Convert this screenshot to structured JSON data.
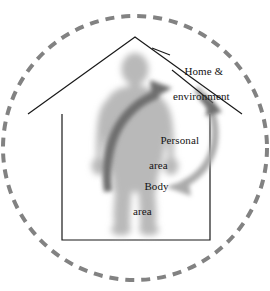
{
  "figure": {
    "width": 270,
    "height": 291,
    "background_color": "#ffffff"
  },
  "labels": {
    "home_environment": {
      "line1": "Home &",
      "line2": "environment",
      "icon": "leader-line-to-outer-arrow"
    },
    "personal_area": {
      "line1": "Personal",
      "line2": "area"
    },
    "body_area": {
      "line1": "Body",
      "line2": "area"
    }
  },
  "shapes": {
    "outer_boundary": {
      "name": "dashed-circle",
      "color": "#808080",
      "stroke_width": 4,
      "dash": "9 7",
      "center_x": 135,
      "center_y": 148,
      "radius": 133
    },
    "house": {
      "name": "house-outline",
      "color": "#1a1a1a",
      "stroke_width": 1.2,
      "apex_x": 135,
      "apex_y": 37,
      "eave_left_x": 28,
      "eave_right_x": 242,
      "eave_y": 114,
      "wall_left_x": 62,
      "wall_right_x": 210,
      "floor_y": 240
    },
    "body_silhouette": {
      "name": "human-figure",
      "color": "#b9b9b9",
      "blur": 4,
      "center_x": 135,
      "head_top_y": 55,
      "feet_y": 233
    },
    "body_area_arrow": {
      "name": "body-area-curved-arrow",
      "color": "#6e6e6e"
    },
    "personal_area_arrow": {
      "name": "personal-area-curved-arrow",
      "color": "#a8a8a8"
    },
    "home_environment_arrow": {
      "name": "home-environment-arrow",
      "color": "#6e6e6e"
    },
    "leader_line": {
      "name": "home-environment-leader-line",
      "color": "#1a1a1a",
      "stroke_width": 1.1
    }
  }
}
